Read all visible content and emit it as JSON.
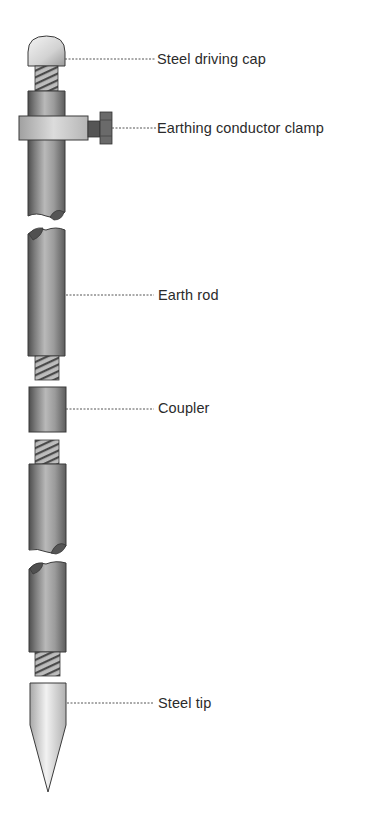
{
  "diagram": {
    "colors": {
      "rod_dark": "#5a5a5a",
      "rod_mid": "#9a9a9a",
      "rod_light": "#c8c8c8",
      "steel_light": "#ececec",
      "outline": "#3a3a3a",
      "leader": "#555555",
      "text": "#2b2b2b"
    },
    "labels": [
      {
        "id": "cap",
        "text": "Steel driving cap",
        "x": 157,
        "y": 51
      },
      {
        "id": "clamp",
        "text": "Earthing conductor clamp",
        "x": 157,
        "y": 120
      },
      {
        "id": "rod",
        "text": "Earth rod",
        "x": 158,
        "y": 287
      },
      {
        "id": "coupler",
        "text": "Coupler",
        "x": 158,
        "y": 400
      },
      {
        "id": "tip",
        "text": "Steel tip",
        "x": 158,
        "y": 695
      }
    ]
  }
}
